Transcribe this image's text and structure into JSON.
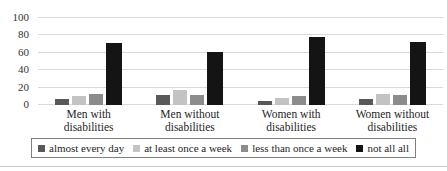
{
  "chart_data": {
    "type": "bar",
    "title": "",
    "categories": [
      "Men with disabilities",
      "Men without disabilities",
      "Women with disabilities",
      "Women without disabilities"
    ],
    "series": [
      {
        "name": "almost every day",
        "color": "#595959",
        "values": [
          7,
          12,
          5,
          7
        ]
      },
      {
        "name": "at least once a week",
        "color": "#c3c3c3",
        "values": [
          10,
          17,
          8,
          13
        ]
      },
      {
        "name": "less than once a week",
        "color": "#8c8c8c",
        "values": [
          13,
          12,
          10,
          12
        ]
      },
      {
        "name": "not all all",
        "color": "#141414",
        "values": [
          71,
          61,
          78,
          72
        ]
      }
    ],
    "xlabel": "",
    "ylabel": "",
    "ylim": [
      0,
      100
    ],
    "yticks": [
      0,
      20,
      40,
      60,
      80,
      100
    ],
    "grid": true,
    "legend_position": "bottom"
  },
  "colors": {
    "gridline": "#d9d9d9",
    "tick_text": "#333333",
    "label_text": "#262626",
    "legend_border": "#7f7f7f",
    "bottom_rule": "#c6c6c6"
  }
}
